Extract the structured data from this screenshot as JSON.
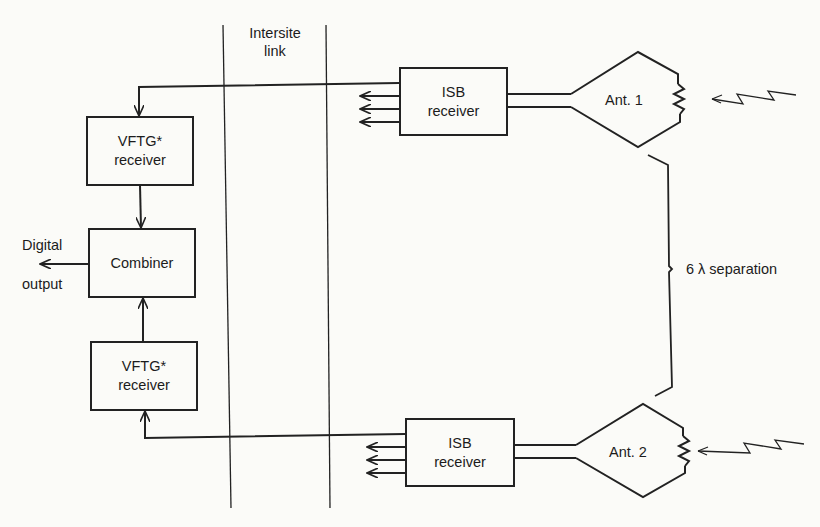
{
  "diagram": {
    "type": "block-diagram",
    "title": "",
    "zones": {
      "intersite_link": "Intersite\nlink",
      "intersite_line1": "Intersite",
      "intersite_line2": "link"
    },
    "blocks": {
      "vftg_top": {
        "line1": "VFTG*",
        "line2": "receiver"
      },
      "combiner": {
        "label": "Combiner"
      },
      "vftg_bottom": {
        "line1": "VFTG*",
        "line2": "receiver"
      },
      "isb_top": {
        "line1": "ISB",
        "line2": "receiver"
      },
      "isb_bottom": {
        "line1": "ISB",
        "line2": "receiver"
      },
      "ant1": {
        "label": "Ant. 1"
      },
      "ant2": {
        "label": "Ant. 2"
      }
    },
    "labels": {
      "output_line1": "Digital",
      "output_line2": "output",
      "separation": "6 λ separation"
    },
    "connections": [
      {
        "from": "ant1",
        "to": "isb_top"
      },
      {
        "from": "isb_top",
        "to": "vftg_top",
        "via": "intersite_link"
      },
      {
        "from": "vftg_top",
        "to": "combiner"
      },
      {
        "from": "vftg_bottom",
        "to": "combiner"
      },
      {
        "from": "isb_bottom",
        "to": "vftg_bottom",
        "via": "intersite_link"
      },
      {
        "from": "ant2",
        "to": "isb_bottom"
      },
      {
        "from": "combiner",
        "to": "digital_output"
      }
    ],
    "colors": {
      "line": "#222222",
      "background": "#fbfbf8"
    }
  }
}
